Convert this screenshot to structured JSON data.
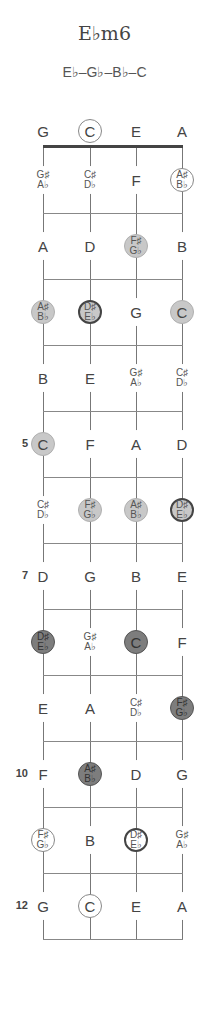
{
  "chord": {
    "name": "E♭m6",
    "notes": "E♭–G♭–B♭–C"
  },
  "fretboard": {
    "strings": [
      "G",
      "C",
      "E",
      "A"
    ],
    "string_x": [
      43,
      90,
      136,
      182
    ],
    "row_y": [
      131,
      180,
      246,
      312,
      378,
      444,
      510,
      576,
      642,
      708,
      774,
      840,
      906
    ],
    "fret_lines_y": [
      213,
      279,
      345,
      411,
      477,
      543,
      609,
      675,
      741,
      807,
      873,
      939
    ],
    "fret_numbers": [
      {
        "fret": 5,
        "label": "5"
      },
      {
        "fret": 7,
        "label": "7"
      },
      {
        "fret": 10,
        "label": "10"
      },
      {
        "fret": 12,
        "label": "12"
      }
    ],
    "rows": [
      {
        "fret": 0,
        "cells": [
          {
            "n1": "G",
            "style": "plain"
          },
          {
            "n1": "C",
            "style": "outline"
          },
          {
            "n1": "E",
            "style": "plain"
          },
          {
            "n1": "A",
            "style": "plain"
          }
        ]
      },
      {
        "fret": 1,
        "cells": [
          {
            "n1": "G♯",
            "n2": "A♭",
            "style": "plain"
          },
          {
            "n1": "C♯",
            "n2": "D♭",
            "style": "plain"
          },
          {
            "n1": "F",
            "style": "plain"
          },
          {
            "n1": "A♯",
            "n2": "B♭",
            "style": "outline"
          }
        ]
      },
      {
        "fret": 2,
        "cells": [
          {
            "n1": "A",
            "style": "plain"
          },
          {
            "n1": "D",
            "style": "plain"
          },
          {
            "n1": "F♯",
            "n2": "G♭",
            "style": "light"
          },
          {
            "n1": "B",
            "style": "plain"
          }
        ]
      },
      {
        "fret": 3,
        "cells": [
          {
            "n1": "A♯",
            "n2": "B♭",
            "style": "light"
          },
          {
            "n1": "D♯",
            "n2": "E♭",
            "style": "light-dark"
          },
          {
            "n1": "G",
            "style": "plain"
          },
          {
            "n1": "C",
            "style": "light"
          }
        ]
      },
      {
        "fret": 4,
        "cells": [
          {
            "n1": "B",
            "style": "plain"
          },
          {
            "n1": "E",
            "style": "plain"
          },
          {
            "n1": "G♯",
            "n2": "A♭",
            "style": "plain"
          },
          {
            "n1": "C♯",
            "n2": "D♭",
            "style": "plain"
          }
        ]
      },
      {
        "fret": 5,
        "cells": [
          {
            "n1": "C",
            "style": "light"
          },
          {
            "n1": "F",
            "style": "plain"
          },
          {
            "n1": "A",
            "style": "plain"
          },
          {
            "n1": "D",
            "style": "plain"
          }
        ]
      },
      {
        "fret": 6,
        "cells": [
          {
            "n1": "C♯",
            "n2": "D♭",
            "style": "plain"
          },
          {
            "n1": "F♯",
            "n2": "G♭",
            "style": "light"
          },
          {
            "n1": "A♯",
            "n2": "B♭",
            "style": "light"
          },
          {
            "n1": "D♯",
            "n2": "E♭",
            "style": "light-dark"
          }
        ]
      },
      {
        "fret": 7,
        "cells": [
          {
            "n1": "D",
            "style": "plain"
          },
          {
            "n1": "G",
            "style": "plain"
          },
          {
            "n1": "B",
            "style": "plain"
          },
          {
            "n1": "E",
            "style": "plain"
          }
        ]
      },
      {
        "fret": 8,
        "cells": [
          {
            "n1": "D♯",
            "n2": "E♭",
            "style": "dark"
          },
          {
            "n1": "G♯",
            "n2": "A♭",
            "style": "plain"
          },
          {
            "n1": "C",
            "style": "dark"
          },
          {
            "n1": "F",
            "style": "plain"
          }
        ]
      },
      {
        "fret": 9,
        "cells": [
          {
            "n1": "E",
            "style": "plain"
          },
          {
            "n1": "A",
            "style": "plain"
          },
          {
            "n1": "C♯",
            "n2": "D♭",
            "style": "plain"
          },
          {
            "n1": "F♯",
            "n2": "G♭",
            "style": "dark"
          }
        ]
      },
      {
        "fret": 10,
        "cells": [
          {
            "n1": "F",
            "style": "plain"
          },
          {
            "n1": "A♯",
            "n2": "B♭",
            "style": "dark"
          },
          {
            "n1": "D",
            "style": "plain"
          },
          {
            "n1": "G",
            "style": "plain"
          }
        ]
      },
      {
        "fret": 11,
        "cells": [
          {
            "n1": "F♯",
            "n2": "G♭",
            "style": "outline"
          },
          {
            "n1": "B",
            "style": "plain"
          },
          {
            "n1": "D♯",
            "n2": "E♭",
            "style": "outline-dark"
          },
          {
            "n1": "G♯",
            "n2": "A♭",
            "style": "plain"
          }
        ]
      },
      {
        "fret": 12,
        "cells": [
          {
            "n1": "G",
            "style": "plain"
          },
          {
            "n1": "C",
            "style": "outline"
          },
          {
            "n1": "E",
            "style": "plain"
          },
          {
            "n1": "A",
            "style": "plain"
          }
        ]
      }
    ]
  },
  "colors": {
    "light_fill": "#c8c8c8",
    "dark_fill": "#7d7d7d",
    "dark_border": "#444444",
    "outline_border": "#888888"
  }
}
